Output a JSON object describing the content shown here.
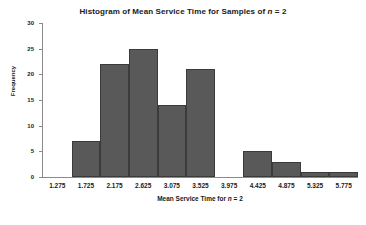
{
  "chart_data": {
    "type": "bar",
    "title": "Histogram of Mean Service Time for Samples of n = 2",
    "title_parts": {
      "before": "Histogram of Mean Service Time for Samples of ",
      "italic": "n",
      "after": " = 2"
    },
    "xlabel": "Mean Service Time for n = 2",
    "xlabel_parts": {
      "before": "Mean Service Time for ",
      "italic": "n",
      "after": " = 2"
    },
    "ylabel": "Frequency",
    "categories": [
      "1.275",
      "1.725",
      "2.175",
      "2.625",
      "3.075",
      "3.525",
      "3.975",
      "4.425",
      "4.875",
      "5.325",
      "5.775"
    ],
    "values": [
      0,
      7,
      22,
      25,
      14,
      21,
      0,
      5,
      3,
      1,
      1
    ],
    "ylim": [
      0,
      30
    ],
    "yticks": [
      0,
      5,
      10,
      15,
      20,
      25,
      30
    ],
    "ytick_labels": [
      "0",
      "5",
      "10",
      "15",
      "20",
      "25",
      "30"
    ],
    "grid": false,
    "legend": "none",
    "bar_color": "#595959",
    "bar_border_color": "#3b3b3b",
    "axis_color": "#8a8a8a",
    "background": "#ffffff"
  }
}
